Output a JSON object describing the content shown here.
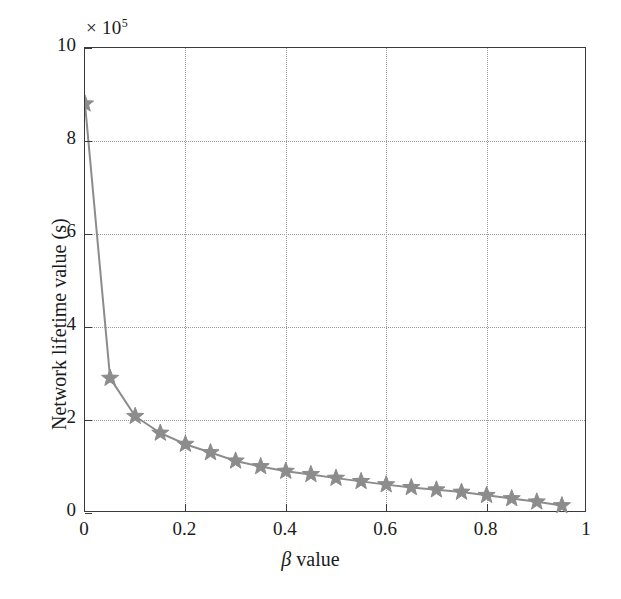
{
  "chart_data": {
    "type": "line",
    "title": "",
    "xlabel": "β value",
    "ylabel": "Network lifetime value (s)",
    "y_multiplier_label": "× 10",
    "y_multiplier_exponent": "5",
    "y_scale_factor": 100000,
    "xlim": [
      0,
      1
    ],
    "ylim": [
      0,
      10
    ],
    "xticks": [
      0,
      0.2,
      0.4,
      0.6,
      0.8,
      1
    ],
    "xticklabels": [
      "0",
      "0.2",
      "0.4",
      "0.6",
      "0.8",
      "1"
    ],
    "yticks": [
      0,
      2,
      4,
      6,
      8,
      10
    ],
    "yticklabels": [
      "0",
      "2",
      "4",
      "6",
      "8",
      "10"
    ],
    "grid": true,
    "grid_style": "dotted",
    "legend": null,
    "marker": "star",
    "line_color": "#8c8c8c",
    "marker_color": "#8c8c8c",
    "x": [
      0,
      0.05,
      0.1,
      0.15,
      0.2,
      0.25,
      0.3,
      0.35,
      0.4,
      0.45,
      0.5,
      0.55,
      0.6,
      0.65,
      0.7,
      0.75,
      0.8,
      0.85,
      0.9,
      0.95
    ],
    "values": [
      8.8,
      2.9,
      2.08,
      1.72,
      1.48,
      1.3,
      1.12,
      1.0,
      0.9,
      0.83,
      0.75,
      0.68,
      0.61,
      0.55,
      0.5,
      0.45,
      0.38,
      0.31,
      0.24,
      0.16
    ],
    "series": [
      {
        "name": "Network lifetime",
        "values": [
          8.8,
          2.9,
          2.08,
          1.72,
          1.48,
          1.3,
          1.12,
          1.0,
          0.9,
          0.83,
          0.75,
          0.68,
          0.61,
          0.55,
          0.5,
          0.45,
          0.38,
          0.31,
          0.24,
          0.16
        ]
      }
    ]
  },
  "axes": {
    "y_exponent_prefix": "× 10",
    "y_exponent_power": "5",
    "y_title": "Network lifetime value (s)",
    "x_title_symbol": "β",
    "x_title_rest": " value"
  }
}
